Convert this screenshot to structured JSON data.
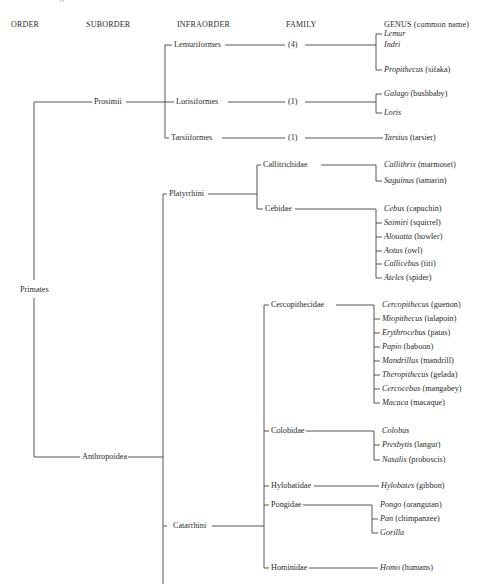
{
  "title": "Figure: A TAXONOMIC CLASSIFICATION OF THE PRIMATES DISCUSSED IN THIS BOOK",
  "headers": {
    "order": "ORDER",
    "suborder": "SUBORDER",
    "infraorder": "INFRAORDER",
    "family": "FAMILY",
    "genus": "GENUS (common name)"
  },
  "order": {
    "label": "Primates"
  },
  "suborders": [
    {
      "label": "Prosimii"
    },
    {
      "label": "Anthropoidea"
    }
  ],
  "infraorders": [
    {
      "label": "Lemuriformes"
    },
    {
      "label": "Lorisiformes"
    },
    {
      "label": "Tarsiiformes"
    },
    {
      "label": "Platyrrhini"
    },
    {
      "label": "Catarrhini"
    }
  ],
  "families": [
    {
      "label": "(4)"
    },
    {
      "label": "(1)"
    },
    {
      "label": "(1)"
    },
    {
      "label": "Callitrichidae"
    },
    {
      "label": "Cebidae"
    },
    {
      "label": "Cercopithecidae"
    },
    {
      "label": "Colobidae"
    },
    {
      "label": "Hylobatidae"
    },
    {
      "label": "Pongidae"
    },
    {
      "label": "Hominidae"
    }
  ],
  "genera": [
    {
      "name": "Lemur",
      "common": ""
    },
    {
      "name": "Indri",
      "common": ""
    },
    {
      "name": "Propithecus",
      "common": "(sifaka)"
    },
    {
      "name": "Galago",
      "common": "(bushbaby)"
    },
    {
      "name": "Loris",
      "common": ""
    },
    {
      "name": "Tarsius",
      "common": "(tarsier)"
    },
    {
      "name": "Callithrix",
      "common": "(marmoset)"
    },
    {
      "name": "Saguinus",
      "common": "(tamarin)"
    },
    {
      "name": "Cebus",
      "common": "(capuchin)"
    },
    {
      "name": "Saimiri",
      "common": "(squirrel)"
    },
    {
      "name": "Alouatta",
      "common": "(howler)"
    },
    {
      "name": "Aotus",
      "common": "(owl)"
    },
    {
      "name": "Callicebus",
      "common": "(titi)"
    },
    {
      "name": "Ateles",
      "common": "(spider)"
    },
    {
      "name": "Cercopithecus",
      "common": "(guenon)"
    },
    {
      "name": "Miopithecus",
      "common": "(talapoin)"
    },
    {
      "name": "Erythrocebus",
      "common": "(patas)"
    },
    {
      "name": "Papio",
      "common": "(baboon)"
    },
    {
      "name": "Mandrillus",
      "common": "(mandrill)"
    },
    {
      "name": "Theropithecus",
      "common": "(gelada)"
    },
    {
      "name": "Cercocebus",
      "common": "(mangabey)"
    },
    {
      "name": "Macaca",
      "common": "(macaque)"
    },
    {
      "name": "Colobus",
      "common": ""
    },
    {
      "name": "Presbytis",
      "common": "(langur)"
    },
    {
      "name": "Nasalis",
      "common": "(proboscis)"
    },
    {
      "name": "Hylobates",
      "common": "(gibbon)"
    },
    {
      "name": "Pongo",
      "common": "(orangutan)"
    },
    {
      "name": "Pan",
      "common": "(chimpanzee)"
    },
    {
      "name": "Gorilla",
      "common": ""
    },
    {
      "name": "Homo",
      "common": "(humans)"
    }
  ]
}
